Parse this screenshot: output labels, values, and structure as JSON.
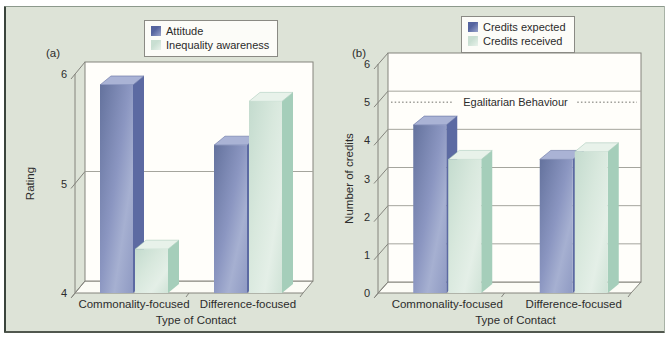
{
  "figure": {
    "panels": [
      "(a)",
      "(b)"
    ]
  },
  "colors": {
    "page_bg": "#ffffff",
    "panel_bg": "#dde3d7",
    "panel_border_dark": "#3a443c",
    "wall": "#fffefa",
    "floor": "#fcfcf6",
    "grid": "#a5a59d",
    "axis": "#84847d",
    "text": "#2c2c2c",
    "ref": "#6e6e68",
    "series": {
      "blue": {
        "front": [
          "#66749f",
          "#8b96c1",
          "#a6b0d1",
          "#8f9ac3"
        ],
        "front_offsets": [
          0,
          0.45,
          0.7,
          1
        ],
        "side": "#5c6aa2",
        "top": "#aab3d5",
        "edge": "#4e5c94",
        "legend0": "#55649f",
        "legend1": "#9aa5cc"
      },
      "green": {
        "front": [
          "#c5dccf",
          "#d8e8dd",
          "#e4efe7",
          "#d0e3d7"
        ],
        "front_offsets": [
          0,
          0.4,
          0.72,
          1
        ],
        "side": "#a5ceba",
        "top": "#e8f2ea",
        "edge": "#9cc2b0",
        "legend0": "#c9dfd2",
        "legend1": "#e9f2eb"
      }
    }
  },
  "chart_data": [
    {
      "type": "bar",
      "style": "3d",
      "panel": "(a)",
      "panel_id": "a",
      "categories": [
        "Commonality-focused",
        "Difference-focused"
      ],
      "series": [
        {
          "name": "Attitude",
          "palette": "blue",
          "values": [
            5.9,
            5.35
          ]
        },
        {
          "name": "Inequality awareness",
          "palette": "green",
          "values": [
            4.4,
            5.75
          ]
        }
      ],
      "xlabel": "Type of Contact",
      "ylabel": "Rating",
      "ylim": [
        4,
        6
      ],
      "yticks": [
        4,
        5,
        6
      ],
      "grid": true,
      "legend_position": "top-center"
    },
    {
      "type": "bar",
      "style": "3d",
      "panel": "(b)",
      "panel_id": "b",
      "categories": [
        "Commonality-focused",
        "Difference-focused"
      ],
      "series": [
        {
          "name": "Credits expected",
          "palette": "blue",
          "values": [
            4.4,
            3.5
          ]
        },
        {
          "name": "Credits received",
          "palette": "green",
          "values": [
            3.5,
            3.7
          ]
        }
      ],
      "xlabel": "Type of Contact",
      "ylabel": "Number of credits",
      "ylim": [
        0,
        6
      ],
      "yticks": [
        0,
        1,
        2,
        3,
        4,
        5,
        6
      ],
      "grid": true,
      "legend_position": "top-center",
      "reference_line": {
        "value": 5,
        "label": "Egalitarian Behaviour",
        "style": "dotted"
      }
    }
  ]
}
